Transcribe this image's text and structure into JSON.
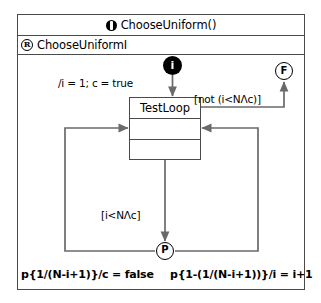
{
  "frame": {
    "title": "ChooseUniform()",
    "title_icon": "operation-icon",
    "region_label": "ChooseUniformI",
    "region_icon": "region-r-icon"
  },
  "nodes": {
    "initial": {
      "label": "i",
      "name": "initial-node"
    },
    "final": {
      "label": "F",
      "name": "final-node"
    },
    "probabilistic": {
      "label": "P",
      "name": "probabilistic-choice-node"
    },
    "state": {
      "name": "TestLoop",
      "compartments": [
        "TestLoop",
        "",
        ""
      ]
    }
  },
  "edges": {
    "init_to_state": "/i = 1; c = true",
    "state_to_final": "[not (i<NΛc)]",
    "state_to_prob": "[i<NΛc]",
    "prob_left": "p{1/(N-i+1)}/c = false",
    "prob_right": "p{1-(1/(N-i+1))}/i = i+1"
  },
  "colors": {
    "line": "#4a4a4a",
    "node_fill": "#000000",
    "background": "#ffffff"
  }
}
